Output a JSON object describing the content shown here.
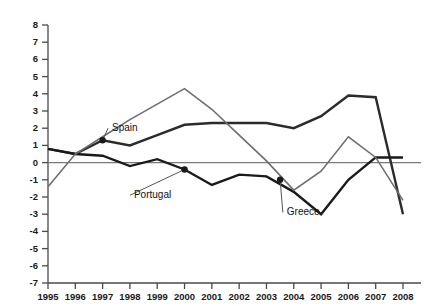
{
  "chart_data": {
    "type": "line",
    "title": "",
    "subtitle": "",
    "xlabel": "",
    "ylabel": "",
    "categories": [
      "1995",
      "1996",
      "1997",
      "1998",
      "1999",
      "2000",
      "2001",
      "2002",
      "2003",
      "2004",
      "2005",
      "2006",
      "2007",
      "2008"
    ],
    "x": [
      1995,
      1996,
      1997,
      1998,
      1999,
      2000,
      2001,
      2002,
      2003,
      2004,
      2005,
      2006,
      2007,
      2008
    ],
    "xlim": [
      1995,
      2008
    ],
    "ylim": [
      -7,
      8
    ],
    "yticks": [
      8,
      7,
      6,
      5,
      4,
      3,
      2,
      1,
      0,
      -1,
      -2,
      -3,
      -4,
      -5,
      -6,
      -7
    ],
    "ytick_labels": [
      "8",
      "7",
      "6",
      "5",
      "4",
      "3",
      "2",
      "1",
      "0",
      "-1",
      "-2",
      "-3",
      "-4",
      "-5",
      "-6",
      "-7"
    ],
    "xtick_labels": [
      "1995",
      "1996",
      "1997",
      "1998",
      "1999",
      "2000",
      "2001",
      "2002",
      "2003",
      "2004",
      "2005",
      "2006",
      "2007",
      "2008"
    ],
    "grid": false,
    "zero_line": true,
    "legend": "inline-annotations",
    "series": [
      {
        "name": "Spain",
        "color": "#2b2b2b",
        "width": 2.4,
        "values": [
          0.8,
          0.5,
          1.3,
          1.0,
          1.6,
          2.2,
          2.3,
          2.3,
          2.3,
          2.0,
          2.7,
          3.9,
          3.8,
          -3.0
        ]
      },
      {
        "name": "Portugal",
        "color": "#1a1a1a",
        "width": 2.4,
        "values": [
          0.8,
          0.5,
          0.4,
          -0.2,
          0.2,
          -0.4,
          -1.3,
          -0.7,
          -0.8,
          -1.7,
          -3.0,
          -1.0,
          0.3,
          0.3
        ]
      },
      {
        "name": "Greece",
        "color": "#6e6e6e",
        "width": 1.6,
        "values": [
          -1.4,
          0.5,
          1.5,
          2.5,
          3.4,
          4.3,
          3.1,
          1.6,
          0.1,
          -1.6,
          -0.5,
          1.5,
          0.3,
          -2.2
        ]
      }
    ],
    "annotations": [
      {
        "label": "Spain",
        "year": 1997,
        "value": 1.3,
        "label_x": 1997.2,
        "label_y": 2.0
      },
      {
        "label": "Portugal",
        "year": 2000,
        "value": -0.4,
        "label_x": 1998.0,
        "label_y": -1.9
      },
      {
        "label": "Greece",
        "year": 2003.5,
        "value": -1.0,
        "label_x": 2003.6,
        "label_y": -2.9
      }
    ]
  }
}
